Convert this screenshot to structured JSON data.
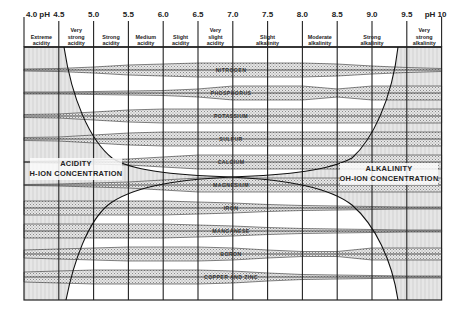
{
  "diagram": {
    "type": "nutrient-availability-vs-soil-pH",
    "axis": {
      "ticks": [
        {
          "label": "4.0 pH",
          "ph": 4.0
        },
        {
          "label": "4.5",
          "ph": 4.5
        },
        {
          "label": "5.0",
          "ph": 5.0
        },
        {
          "label": "5.5",
          "ph": 5.5
        },
        {
          "label": "6.0",
          "ph": 6.0
        },
        {
          "label": "6.5",
          "ph": 6.5
        },
        {
          "label": "7.0",
          "ph": 7.0
        },
        {
          "label": "7.5",
          "ph": 7.5
        },
        {
          "label": "8.0",
          "ph": 8.0
        },
        {
          "label": "8.5",
          "ph": 8.5
        },
        {
          "label": "9.0",
          "ph": 9.0
        },
        {
          "label": "9.5",
          "ph": 9.5
        },
        {
          "label": "pH 10",
          "ph": 10.0
        }
      ]
    },
    "zones": [
      {
        "line1": "Extreme",
        "line2": "acidity"
      },
      {
        "line0": "Very",
        "line1": "strong",
        "line2": "acidity"
      },
      {
        "line1": "Strong",
        "line2": "acidity"
      },
      {
        "line1": "Medium",
        "line2": "acidity"
      },
      {
        "line1": "Slight",
        "line2": "acidity"
      },
      {
        "line0": "Very",
        "line1": "slight",
        "line2": "acidity"
      },
      {
        "line1": "Slight",
        "line2": "alkalinity"
      },
      {
        "line1": "Moderate",
        "line2": "alkalinity"
      },
      {
        "line1": "Strong",
        "line2": "alkalinity"
      },
      {
        "line0": "Very",
        "line1": "strong",
        "line2": "alkalinity"
      }
    ],
    "nutrients": [
      "NITROGEN",
      "PHOSPHORUS",
      "POTASSIUM",
      "SULFUR",
      "CALCIUM",
      "MAGNESIUM",
      "IRON",
      "MANGANESE",
      "BORON",
      "COPPER AND ZINC"
    ],
    "acidity": {
      "line1": "ACIDITY",
      "line2": "H-ION CONCENTRATION"
    },
    "alkalinity": {
      "line1": "ALKALINITY",
      "line2": "OH-ION CONCENTRATION"
    }
  }
}
